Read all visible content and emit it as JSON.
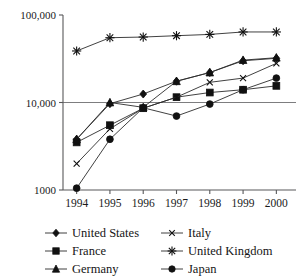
{
  "chart_data": {
    "type": "line",
    "title": "",
    "subtitle": "",
    "xlabel": "",
    "ylabel": "",
    "x": [
      "1994",
      "1995",
      "1996",
      "1997",
      "1998",
      "1999",
      "2000"
    ],
    "categories": [
      "1994",
      "1995",
      "1996",
      "1997",
      "1998",
      "1999",
      "2000"
    ],
    "yscale": "log",
    "ylim": [
      1000,
      100000
    ],
    "ytick_labels": [
      "100,000",
      "10,000",
      "1000"
    ],
    "ytick_values": [
      100000,
      10000,
      1000
    ],
    "grid": "horizontal gridline at 10,000 only",
    "legend_position": "bottom",
    "series": [
      {
        "name": "United States",
        "marker": "diamond",
        "values": [
          3800,
          9700,
          12500,
          17500,
          22000,
          30000,
          32000
        ]
      },
      {
        "name": "France",
        "marker": "square",
        "values": [
          3500,
          5500,
          8600,
          11500,
          13000,
          14000,
          15500
        ]
      },
      {
        "name": "Germany",
        "marker": "triangle",
        "values": [
          3800,
          10000,
          8800,
          17500,
          22000,
          30500,
          32500
        ]
      },
      {
        "name": "Italy",
        "marker": "x",
        "values": [
          2000,
          5000,
          8600,
          11500,
          17000,
          19000,
          28000
        ]
      },
      {
        "name": "United Kingdom",
        "marker": "asterisk",
        "values": [
          38800,
          55000,
          56000,
          58000,
          60000,
          64000,
          64000
        ]
      },
      {
        "name": "Japan",
        "marker": "circle",
        "values": [
          1050,
          3800,
          8700,
          7000,
          9600,
          14000,
          19000
        ]
      }
    ]
  },
  "axes": {
    "y_ticks": [
      {
        "label": "100,000",
        "value": 100000
      },
      {
        "label": "10,000",
        "value": 10000
      },
      {
        "label": "1000",
        "value": 1000
      }
    ],
    "x_ticks": [
      {
        "label": "1994"
      },
      {
        "label": "1995"
      },
      {
        "label": "1996"
      },
      {
        "label": "1997"
      },
      {
        "label": "1998"
      },
      {
        "label": "1999"
      },
      {
        "label": "2000"
      }
    ]
  },
  "legend": {
    "entries": [
      {
        "label": "United States",
        "marker": "diamond"
      },
      {
        "label": "Italy",
        "marker": "x"
      },
      {
        "label": "France",
        "marker": "square"
      },
      {
        "label": "United Kingdom",
        "marker": "asterisk"
      },
      {
        "label": "Germany",
        "marker": "triangle"
      },
      {
        "label": "Japan",
        "marker": "circle"
      }
    ]
  },
  "colors": {
    "ink": "#111111",
    "axis": "#58585a",
    "grid": "#6e6e70",
    "background": "#ffffff"
  }
}
